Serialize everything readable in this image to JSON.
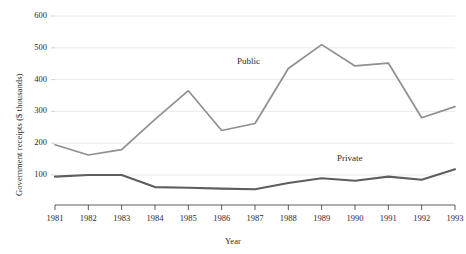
{
  "chart_data": {
    "type": "line",
    "title": "",
    "xlabel": "Year",
    "ylabel": "Government receipts ($ thousands)",
    "x": [
      1981,
      1982,
      1983,
      1984,
      1985,
      1986,
      1987,
      1988,
      1989,
      1990,
      1991,
      1992,
      1993
    ],
    "xticklabels": [
      "1981",
      "1982",
      "1983",
      "1984",
      "1985",
      "1986",
      "1987",
      "1988",
      "1989",
      "1990",
      "1991",
      "1992",
      "1993"
    ],
    "yticks": [
      100,
      200,
      300,
      400,
      500,
      600
    ],
    "yticklabels": [
      "100",
      "200",
      "300",
      "400",
      "500",
      "600"
    ],
    "ylim": [
      40,
      620
    ],
    "xlim": [
      1981,
      1993
    ],
    "grid": "horizontal",
    "legend_position": "inline-annotation",
    "series": [
      {
        "name": "Public",
        "color": "#8f8f8f",
        "label_x": 1987.0,
        "label_y": 455,
        "values": [
          195,
          163,
          180,
          275,
          365,
          240,
          262,
          435,
          510,
          443,
          452,
          280,
          315
        ]
      },
      {
        "name": "Private",
        "color": "#5e5e5e",
        "label_x": 1990.0,
        "label_y": 150,
        "values": [
          95,
          100,
          100,
          62,
          60,
          57,
          55,
          75,
          90,
          82,
          95,
          85,
          118
        ]
      }
    ],
    "annotations": [
      {
        "text": "Public",
        "x": 1987.0,
        "y": 455
      },
      {
        "text": "Private",
        "x": 1990.0,
        "y": 150
      }
    ]
  },
  "axes": {
    "y_title": "Government receipts ($ thousands)",
    "x_title": "Year"
  }
}
